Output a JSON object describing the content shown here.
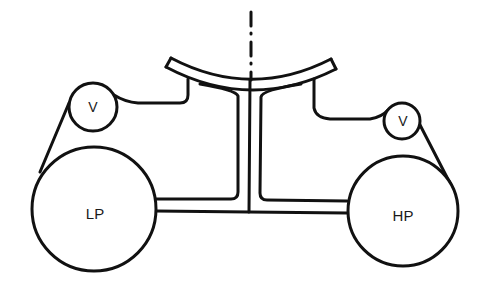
{
  "diagram": {
    "type": "schematic",
    "colors": {
      "stroke": "#111111",
      "background": "#ffffff"
    },
    "labels": {
      "left_small_pulley": "V",
      "right_small_pulley": "V",
      "left_large_pulley": "LP",
      "right_large_pulley": "HP"
    },
    "elements": [
      {
        "name": "centerline",
        "style": "dash-dot"
      },
      {
        "name": "curved-top-band"
      },
      {
        "name": "central-stem"
      },
      {
        "name": "left-duct"
      },
      {
        "name": "right-duct"
      },
      {
        "name": "left-belt"
      },
      {
        "name": "right-belt"
      }
    ]
  }
}
